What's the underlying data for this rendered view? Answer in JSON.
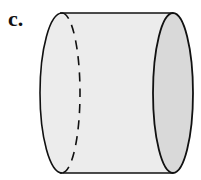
{
  "figure": {
    "label": "c.",
    "shape": "cylinder",
    "orientation": "horizontal",
    "hidden_edge": "dashed",
    "colors": {
      "body": "#ececec",
      "end_face": "#d9d9d9",
      "stroke": "#111111"
    }
  }
}
